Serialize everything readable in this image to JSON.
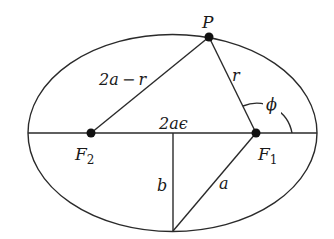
{
  "diagram": {
    "type": "ellipse-geometry",
    "colors": {
      "line": "#2a2a2a",
      "point": "#111111",
      "text": "#1a1a1a"
    },
    "points": {
      "P": {
        "label": "P"
      },
      "F1": {
        "label": "F",
        "subscript": "1"
      },
      "F2": {
        "label": "F",
        "subscript": "2"
      }
    },
    "segment_labels": {
      "p_to_f2": "2a − r",
      "p_to_f1": "r",
      "focal_distance": "2aϵ",
      "semi_minor": "b",
      "f1_to_bottom": "a"
    },
    "angle_label": "ϕ"
  }
}
